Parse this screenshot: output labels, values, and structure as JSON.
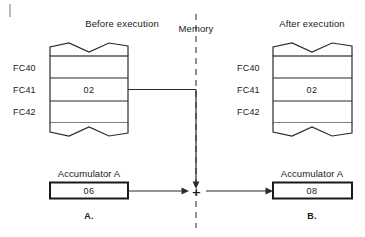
{
  "figure": {
    "title_left": "Before execution",
    "title_right": "After execution",
    "memory_label": "Memory",
    "caption_left": "A.",
    "caption_right": "B."
  },
  "memory_before": {
    "addresses": [
      "FC40",
      "FC41",
      "FC42"
    ],
    "values": [
      "",
      "02",
      ""
    ]
  },
  "memory_after": {
    "addresses": [
      "FC40",
      "FC41",
      "FC42"
    ],
    "values": [
      "",
      "02",
      ""
    ]
  },
  "accumulator_before": {
    "caption": "Accumulator A",
    "value": "06"
  },
  "accumulator_after": {
    "caption": "Accumulator A",
    "value": "08"
  },
  "operator": {
    "symbol": "+"
  },
  "colors": {
    "ink": "#1a1a1a",
    "line": "#2b2b2b",
    "background": "#ffffff"
  }
}
